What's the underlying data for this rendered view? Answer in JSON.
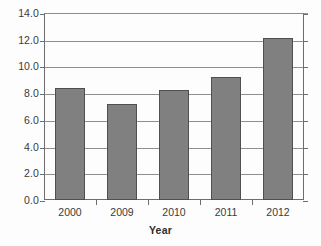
{
  "chart_data": {
    "type": "bar",
    "title": "",
    "xlabel": "Year",
    "ylabel": "",
    "categories": [
      "2000",
      "2009",
      "2010",
      "2011",
      "2012"
    ],
    "values": [
      8.4,
      7.2,
      8.2,
      9.2,
      12.1
    ],
    "ylim": [
      0.0,
      14.0
    ],
    "ytick_labels": [
      "0.0",
      "2.0",
      "4.0",
      "6.0",
      "8.0",
      "10.0",
      "12.0",
      "14.0"
    ],
    "ytick_values": [
      0.0,
      2.0,
      4.0,
      6.0,
      8.0,
      10.0,
      12.0,
      14.0
    ],
    "grid": true,
    "legend": false,
    "bar_color": "#808080",
    "bar_edge_color": "#4f4f4f",
    "axis_color": "#6d6d6d",
    "grid_color": "#8f8f8f",
    "background": "#ffffff"
  }
}
